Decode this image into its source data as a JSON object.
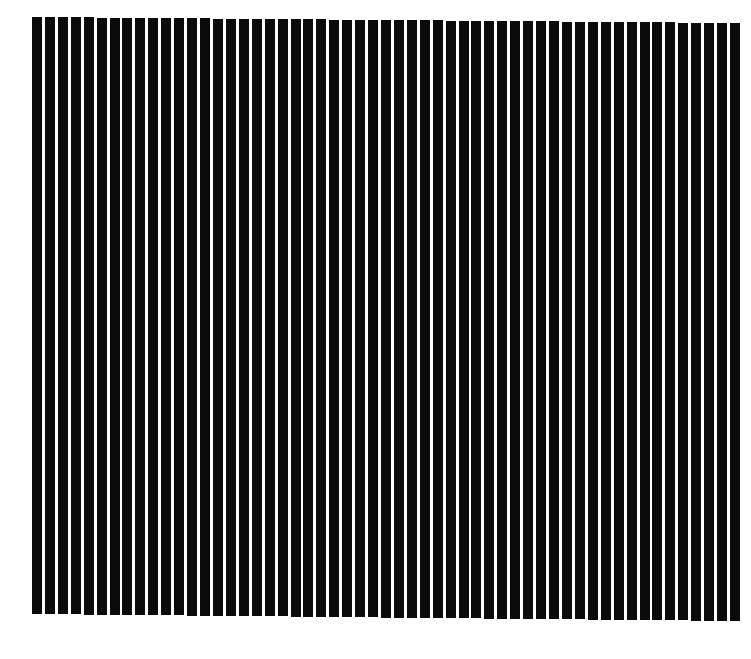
{
  "pattern": {
    "type": "vertical-stripe-grating",
    "bar_count": 55,
    "bar_color": "#0b0b0b",
    "gap_color": "#ffffff",
    "background_color": "#ffffff",
    "first_bar_x": 32,
    "last_bar_right_x": 740,
    "bar_width": 10,
    "period": 12.9,
    "top_left_y": 17,
    "top_right_y": 23,
    "bottom_left_y": 614,
    "bottom_right_y": 621
  }
}
